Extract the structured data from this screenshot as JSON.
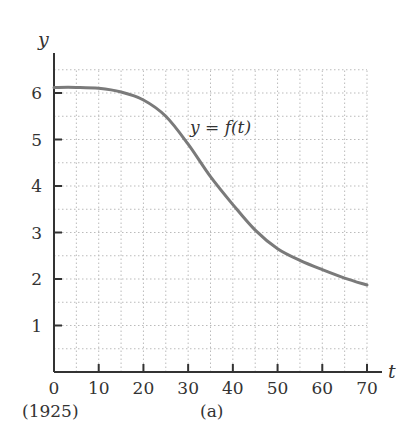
{
  "chart_data": {
    "type": "line",
    "title": "",
    "xlabel": "t",
    "ylabel": "y",
    "xlim": [
      0,
      70
    ],
    "ylim": [
      0,
      6.5
    ],
    "grid": true,
    "x_ticks": [
      0,
      10,
      20,
      30,
      40,
      50,
      60,
      70
    ],
    "x_tick_labels": [
      "0",
      "10",
      "20",
      "30",
      "40",
      "50",
      "60",
      "70"
    ],
    "y_ticks": [
      1,
      2,
      3,
      4,
      5,
      6
    ],
    "y_tick_labels": [
      "1",
      "2",
      "3",
      "4",
      "5",
      "6"
    ],
    "x_origin_annotation": "(1925)",
    "caption": "(a)",
    "series": [
      {
        "name": "y = f(t)",
        "x": [
          0,
          5,
          10,
          15,
          20,
          25,
          30,
          35,
          40,
          45,
          50,
          55,
          60,
          65,
          70
        ],
        "values": [
          6.12,
          6.12,
          6.1,
          6.02,
          5.85,
          5.5,
          4.9,
          4.2,
          3.6,
          3.05,
          2.65,
          2.4,
          2.2,
          2.02,
          1.87
        ]
      }
    ],
    "annotations": [
      {
        "text": "y = f(t)",
        "x": 38,
        "y": 5.3
      }
    ]
  },
  "labels": {
    "y_axis": "y",
    "x_axis": "t",
    "curve": "y = f(t)",
    "origin_year": "(1925)",
    "caption": "(a)"
  }
}
